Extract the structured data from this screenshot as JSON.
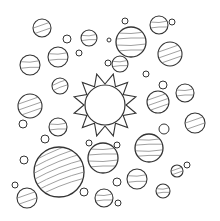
{
  "scene": {
    "title": "Sun and planets coloring page",
    "width": 220,
    "height": 221,
    "background": "#ffffff",
    "stroke": "#333333",
    "stripe_stroke": "#777777"
  },
  "sun": {
    "cx": 105,
    "cy": 105,
    "r": 20,
    "ray_inner": 21,
    "ray_outer": 32,
    "rays": 12
  },
  "planets": [
    {
      "cx": 42,
      "cy": 28,
      "r": 9,
      "style": "diagonal"
    },
    {
      "cx": 58,
      "cy": 57,
      "r": 10,
      "style": "horizontal"
    },
    {
      "cx": 89,
      "cy": 38,
      "r": 8,
      "style": "horizontal"
    },
    {
      "cx": 131,
      "cy": 42,
      "r": 15,
      "style": "horizontal"
    },
    {
      "cx": 159,
      "cy": 25,
      "r": 9,
      "style": "horizontal"
    },
    {
      "cx": 170,
      "cy": 54,
      "r": 12,
      "style": "diagonal"
    },
    {
      "cx": 120,
      "cy": 64,
      "r": 8,
      "style": "horizontal"
    },
    {
      "cx": 30,
      "cy": 65,
      "r": 10,
      "style": "horizontal"
    },
    {
      "cx": 60,
      "cy": 86,
      "r": 8,
      "style": "swirl"
    },
    {
      "cx": 30,
      "cy": 106,
      "r": 12,
      "style": "diagonal"
    },
    {
      "cx": 158,
      "cy": 102,
      "r": 11,
      "style": "diagonal"
    },
    {
      "cx": 185,
      "cy": 93,
      "r": 9,
      "style": "horizontal"
    },
    {
      "cx": 195,
      "cy": 123,
      "r": 10,
      "style": "diagonal"
    },
    {
      "cx": 149,
      "cy": 148,
      "r": 14,
      "style": "horizontal"
    },
    {
      "cx": 103,
      "cy": 158,
      "r": 15,
      "style": "horizontal"
    },
    {
      "cx": 58,
      "cy": 127,
      "r": 9,
      "style": "horizontal"
    },
    {
      "cx": 59,
      "cy": 172,
      "r": 25,
      "style": "swirl"
    },
    {
      "cx": 27,
      "cy": 198,
      "r": 10,
      "style": "diagonal"
    },
    {
      "cx": 104,
      "cy": 198,
      "r": 9,
      "style": "horizontal"
    },
    {
      "cx": 137,
      "cy": 179,
      "r": 10,
      "style": "horizontal"
    },
    {
      "cx": 177,
      "cy": 171,
      "r": 6,
      "style": "diagonal"
    },
    {
      "cx": 163,
      "cy": 191,
      "r": 7,
      "style": "horizontal"
    }
  ],
  "moons": [
    {
      "cx": 67,
      "cy": 39,
      "r": 4
    },
    {
      "cx": 79,
      "cy": 53,
      "r": 3
    },
    {
      "cx": 109,
      "cy": 40,
      "r": 2
    },
    {
      "cx": 108,
      "cy": 63,
      "r": 3
    },
    {
      "cx": 125,
      "cy": 21,
      "r": 3
    },
    {
      "cx": 172,
      "cy": 22,
      "r": 3
    },
    {
      "cx": 146,
      "cy": 74,
      "r": 3
    },
    {
      "cx": 163,
      "cy": 85,
      "r": 4
    },
    {
      "cx": 164,
      "cy": 129,
      "r": 5
    },
    {
      "cx": 187,
      "cy": 165,
      "r": 3
    },
    {
      "cx": 23,
      "cy": 124,
      "r": 4
    },
    {
      "cx": 45,
      "cy": 139,
      "r": 4
    },
    {
      "cx": 24,
      "cy": 160,
      "r": 4
    },
    {
      "cx": 15,
      "cy": 185,
      "r": 3
    },
    {
      "cx": 89,
      "cy": 143,
      "r": 3
    },
    {
      "cx": 117,
      "cy": 145,
      "r": 3
    },
    {
      "cx": 117,
      "cy": 182,
      "r": 4
    },
    {
      "cx": 84,
      "cy": 192,
      "r": 4
    },
    {
      "cx": 118,
      "cy": 203,
      "r": 3
    }
  ]
}
